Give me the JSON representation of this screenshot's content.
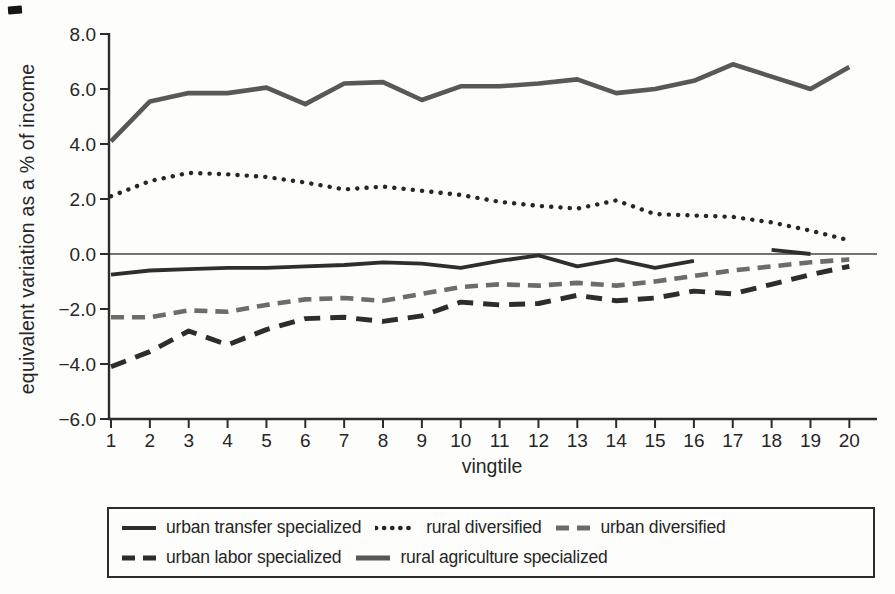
{
  "chart_data": {
    "type": "line",
    "title": "",
    "xlabel": "vingtile",
    "ylabel": "equivalent variation as a % of income",
    "categories": [
      1,
      2,
      3,
      4,
      5,
      6,
      7,
      8,
      9,
      10,
      11,
      12,
      13,
      14,
      15,
      16,
      17,
      18,
      19,
      20
    ],
    "xlim": [
      1,
      20
    ],
    "ylim": [
      -6.0,
      8.0
    ],
    "grid": false,
    "zero_line": true,
    "legend_position": "bottom-box",
    "y_ticks": [
      {
        "value": 8.0,
        "label": "8.0"
      },
      {
        "value": 6.0,
        "label": "6.0"
      },
      {
        "value": 4.0,
        "label": "4.0"
      },
      {
        "value": 2.0,
        "label": "2.0"
      },
      {
        "value": 0.0,
        "label": "0.0"
      },
      {
        "value": -2.0,
        "label": "−2.0"
      },
      {
        "value": -4.0,
        "label": "−4.0"
      },
      {
        "value": -6.0,
        "label": "−6.0"
      }
    ],
    "series": [
      {
        "name": "urban transfer specialized",
        "line_style": "solid",
        "color": "#2e2e2e",
        "values": [
          -0.75,
          -0.6,
          -0.55,
          -0.5,
          -0.5,
          -0.45,
          -0.4,
          -0.3,
          -0.35,
          -0.5,
          -0.25,
          -0.05,
          -0.45,
          -0.2,
          -0.5,
          -0.25,
          null,
          0.15,
          0.0,
          null
        ]
      },
      {
        "name": "rural diversified",
        "line_style": "dotted",
        "color": "#262626",
        "values": [
          2.1,
          2.65,
          2.95,
          2.9,
          2.8,
          2.6,
          2.35,
          2.45,
          2.3,
          2.15,
          1.9,
          1.75,
          1.65,
          1.95,
          1.45,
          1.4,
          1.35,
          1.15,
          0.85,
          0.5
        ]
      },
      {
        "name": "urban diversified",
        "line_style": "dashed",
        "color": "#6c6c6c",
        "values": [
          -2.3,
          -2.3,
          -2.05,
          -2.1,
          -1.85,
          -1.65,
          -1.6,
          -1.7,
          -1.45,
          -1.2,
          -1.1,
          -1.15,
          -1.05,
          -1.15,
          -1.0,
          -0.8,
          -0.6,
          -0.45,
          -0.3,
          -0.2
        ]
      },
      {
        "name": "urban labor specialized",
        "line_style": "dashed",
        "color": "#2d2d2d",
        "values": [
          -4.1,
          -3.55,
          -2.8,
          -3.3,
          -2.75,
          -2.35,
          -2.3,
          -2.45,
          -2.25,
          -1.75,
          -1.85,
          -1.8,
          -1.5,
          -1.7,
          -1.6,
          -1.35,
          -1.45,
          -1.1,
          -0.75,
          -0.45
        ]
      },
      {
        "name": "rural agriculture specialized",
        "line_style": "solid",
        "color": "#585858",
        "values": [
          4.1,
          5.55,
          5.85,
          5.85,
          6.05,
          5.45,
          6.2,
          6.25,
          5.6,
          6.1,
          6.1,
          6.2,
          6.35,
          5.85,
          6.0,
          6.3,
          6.9,
          6.45,
          6.0,
          6.8
        ]
      }
    ],
    "legend_rows": [
      [
        0,
        1,
        2
      ],
      [
        3,
        4
      ]
    ]
  }
}
